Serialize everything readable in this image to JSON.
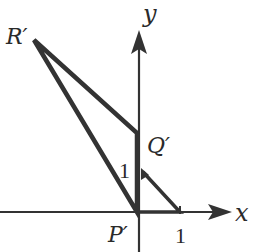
{
  "diagram": {
    "axes": {
      "x_label": "x",
      "y_label": "y"
    },
    "points": {
      "R_prime": "R′",
      "Q_prime": "Q′",
      "P_prime": "P′"
    },
    "ticks": {
      "x_one": "1",
      "y_one": "1"
    },
    "colors": {
      "stroke": "#333333",
      "background": "#ffffff"
    }
  }
}
